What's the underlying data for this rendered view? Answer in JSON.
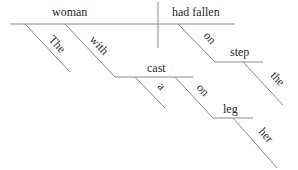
{
  "diagram": {
    "type": "Reed-Kellogg sentence diagram",
    "subject": "woman",
    "verb": "had fallen",
    "modifiers": {
      "the": "The",
      "with": "with",
      "cast": "cast",
      "a": "a",
      "on_cast": "on",
      "leg": "leg",
      "her": "her",
      "on_verb": "on",
      "step": "step",
      "the_step": "the"
    },
    "line_color": "#8a8a8a",
    "text_color": "#2a2a2a"
  }
}
